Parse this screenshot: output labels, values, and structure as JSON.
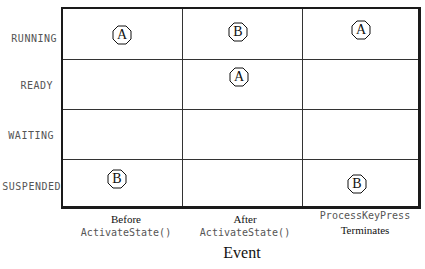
{
  "rows": [
    {
      "label": "RUNNING"
    },
    {
      "label": "READY"
    },
    {
      "label": "WAITING"
    },
    {
      "label": "SUSPENDED"
    }
  ],
  "columns": [
    {
      "line1": "Before",
      "line1_style": "serif",
      "line2": "ActivateState()",
      "line2_style": "mono"
    },
    {
      "line1": "After",
      "line1_style": "serif",
      "line2": "ActivateState()",
      "line2_style": "mono"
    },
    {
      "line1": "ProcessKeyPress",
      "line1_style": "mono",
      "line2": "Terminates",
      "line2_style": "serif"
    }
  ],
  "x_axis_title": "Event",
  "markers": [
    {
      "row": "RUNNING",
      "column": 0,
      "label": "A"
    },
    {
      "row": "RUNNING",
      "column": 1,
      "label": "B"
    },
    {
      "row": "RUNNING",
      "column": 2,
      "label": "A"
    },
    {
      "row": "READY",
      "column": 1,
      "label": "A"
    },
    {
      "row": "SUSPENDED",
      "column": 0,
      "label": "B"
    },
    {
      "row": "SUSPENDED",
      "column": 2,
      "label": "B"
    }
  ],
  "colors": {
    "line": "#1a1a1a",
    "mono_text": "#555555",
    "serif_text": "#111111"
  }
}
